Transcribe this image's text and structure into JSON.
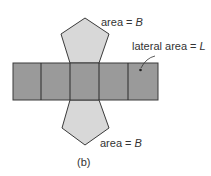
{
  "figure": {
    "caption": "(b)",
    "top_base_label": {
      "prefix": "area = ",
      "var": "B"
    },
    "bottom_base_label": {
      "prefix": "area = ",
      "var": "B"
    },
    "lateral_label": {
      "prefix": "lateral area = ",
      "var": "L"
    },
    "lateral_faces": 5,
    "colors": {
      "lateral_fill": "#9a9a9a",
      "base_fill": "#d8d8d8",
      "stroke": "#3a3a3a"
    }
  }
}
